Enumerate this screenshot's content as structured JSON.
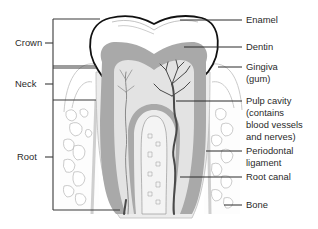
{
  "left_labels": [
    {
      "id": "crown",
      "text": "Crown"
    },
    {
      "id": "neck",
      "text": "Neck"
    },
    {
      "id": "root",
      "text": "Root"
    }
  ],
  "right_labels": [
    {
      "id": "enamel",
      "lines": [
        "Enamel"
      ]
    },
    {
      "id": "dentin",
      "lines": [
        "Dentin"
      ]
    },
    {
      "id": "gingiva",
      "lines": [
        "Gingiva",
        "(gum)"
      ]
    },
    {
      "id": "pulp-cavity",
      "lines": [
        "Pulp cavity",
        "(contains",
        "blood vessels",
        "and nerves)"
      ]
    },
    {
      "id": "periodontal-ligament",
      "lines": [
        "Periodontal",
        "ligament"
      ]
    },
    {
      "id": "root-canal",
      "lines": [
        "Root canal"
      ]
    },
    {
      "id": "bone",
      "lines": [
        "Bone"
      ]
    }
  ],
  "colors": {
    "enamel": "#ffffff",
    "dentin": "#a9a9a9",
    "pulp": "#e3e3e3",
    "vessels": "#4a4a4a",
    "outline": "#111111",
    "text": "#2a2a2a"
  }
}
